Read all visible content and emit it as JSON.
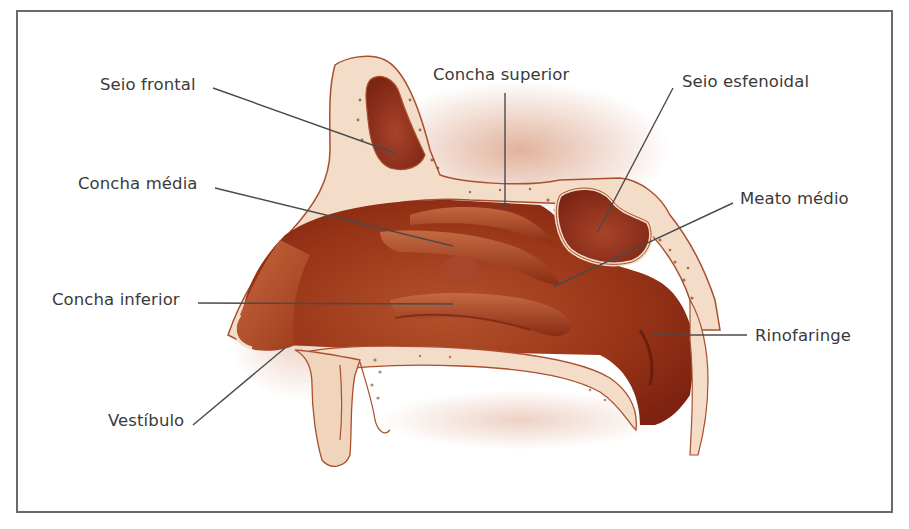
{
  "figure": {
    "colors": {
      "frame": "#6a6a6a",
      "label_text": "#3a3a3a",
      "leader_line": "#4a4a4a",
      "tissue_dark": "#8e2a12",
      "tissue_mid": "#b04a26",
      "tissue_light": "#d98a62",
      "bone": "#f3ddc8",
      "bone_outline": "#a8502e"
    },
    "labels": [
      {
        "id": "seio-frontal",
        "text": "Seio frontal"
      },
      {
        "id": "concha-superior",
        "text": "Concha superior"
      },
      {
        "id": "seio-esfenoidal",
        "text": "Seio esfenoidal"
      },
      {
        "id": "concha-media",
        "text": "Concha média"
      },
      {
        "id": "meato-medio",
        "text": "Meato médio"
      },
      {
        "id": "concha-inferior",
        "text": "Concha inferior"
      },
      {
        "id": "rinofaringe",
        "text": "Rinofaringe"
      },
      {
        "id": "vestibulo",
        "text": "Vestíbulo"
      }
    ]
  }
}
